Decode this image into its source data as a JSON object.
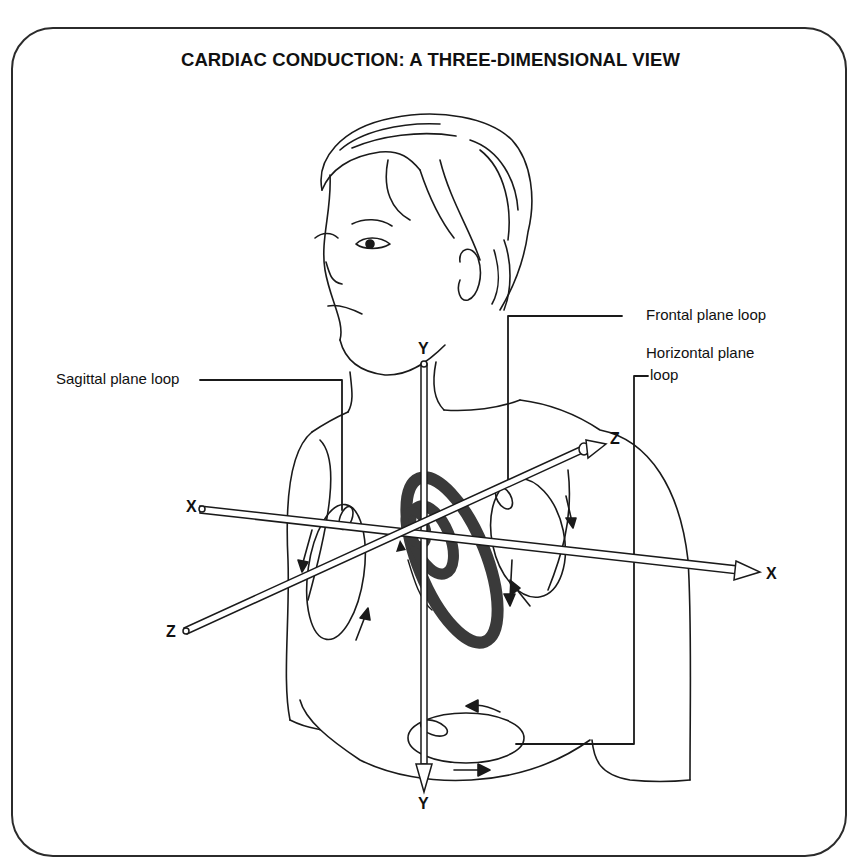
{
  "title": "CARDIAC CONDUCTION: A THREE-DIMENSIONAL VIEW",
  "labels": {
    "sagittal": "Sagittal plane loop",
    "frontal": "Frontal plane loop",
    "horizontal_line1": "Horizontal plane",
    "horizontal_line2": "loop"
  },
  "axes": {
    "y_top": "Y",
    "y_bottom": "Y",
    "x_left": "X",
    "x_right": "X",
    "z_upper": "Z",
    "z_lower": "Z"
  },
  "colors": {
    "ink": "#1a1a1a",
    "loop_fill": "#3a3a3a",
    "frame": "#2b2b2b"
  }
}
